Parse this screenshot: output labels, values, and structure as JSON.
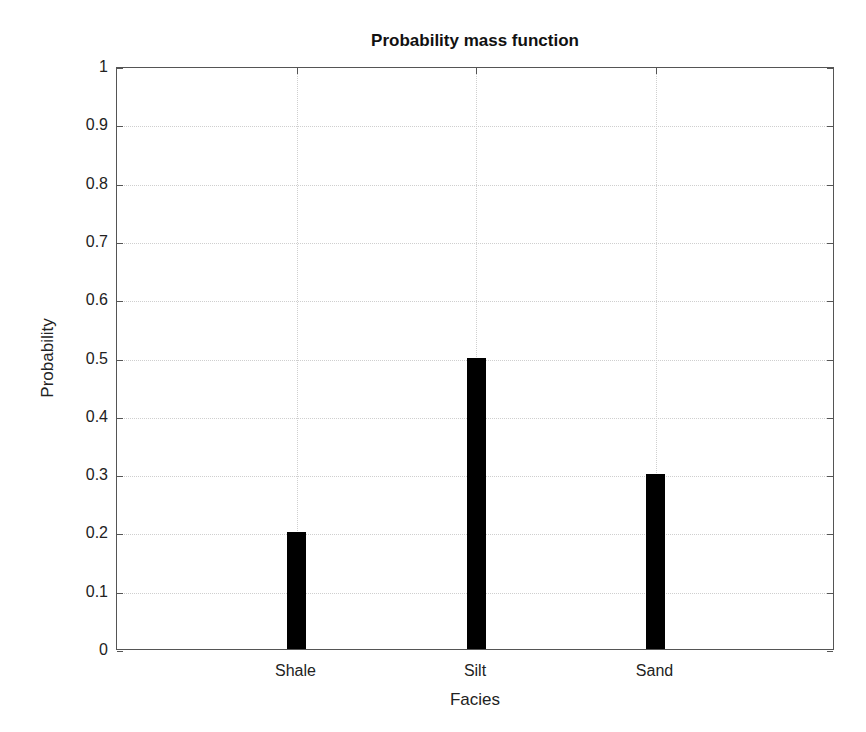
{
  "chart_data": {
    "type": "bar",
    "title": "Probability mass function",
    "xlabel": "Facies",
    "ylabel": "Probability",
    "categories": [
      "Shale",
      "Silt",
      "Sand"
    ],
    "values": [
      0.2,
      0.5,
      0.3
    ],
    "ylim": [
      0,
      1
    ],
    "yticks": [
      "0",
      "0.1",
      "0.2",
      "0.3",
      "0.4",
      "0.5",
      "0.6",
      "0.7",
      "0.8",
      "0.9",
      "1"
    ],
    "grid": true,
    "legend": null,
    "bar_color": "#000000"
  }
}
